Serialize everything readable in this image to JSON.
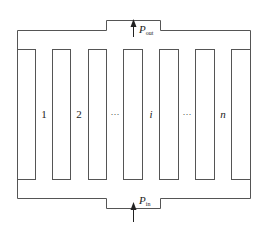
{
  "diagram": {
    "type": "parallel-channel-flow-schematic",
    "line_color": "#555555",
    "channels": [
      {
        "label": "1",
        "italic": false
      },
      {
        "label": "2",
        "italic": false
      },
      {
        "label": "···",
        "italic": false
      },
      {
        "label": "i",
        "italic": true
      },
      {
        "label": "···",
        "italic": false
      },
      {
        "label": "n",
        "italic": true
      }
    ],
    "outlet": {
      "symbol": "P",
      "subscript": "out"
    },
    "inlet": {
      "symbol": "P",
      "subscript": "in"
    }
  }
}
